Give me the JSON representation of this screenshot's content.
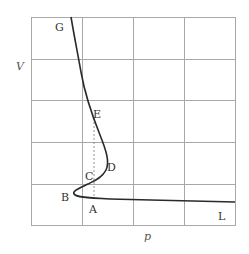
{
  "figure": {
    "type": "p-V isotherm diagram",
    "axes": {
      "x_label": "p",
      "y_label": "V"
    },
    "grid": {
      "columns": 4,
      "rows": 5
    },
    "point_labels": {
      "G": "G",
      "E": "E",
      "D": "D",
      "C": "C",
      "B": "B",
      "A": "A",
      "L": "L"
    },
    "colors": {
      "curve": "#2a2a2a",
      "grid": "#a8a8a8",
      "dotted_line": "#888888"
    }
  }
}
